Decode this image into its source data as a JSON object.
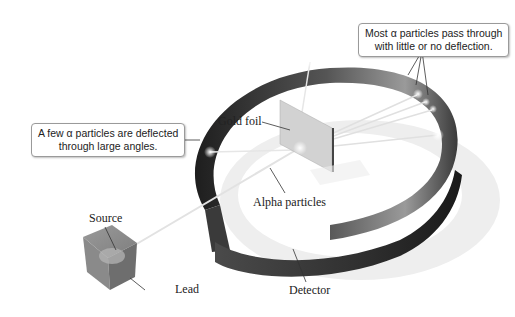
{
  "diagram": {
    "callouts": {
      "most_pass": {
        "line1": "Most α particles pass through",
        "line2": "with little or no deflection."
      },
      "few_deflected": {
        "line1": "A few α particles are deflected",
        "line2": "through large angles."
      }
    },
    "labels": {
      "gold_foil": "Gold foil",
      "alpha_particles": "Alpha particles",
      "source": "Source",
      "lead": "Lead",
      "detector": "Detector"
    },
    "colors": {
      "detector_dark": "#2e2e2e",
      "detector_light": "#8a8a8a",
      "lead_block": "#8c8c8c",
      "foil": "#cfcfcf",
      "beam": "#e8e8e8"
    }
  }
}
